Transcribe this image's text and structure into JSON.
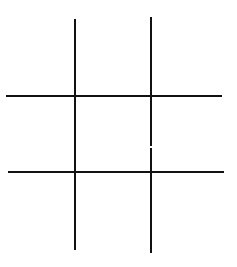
{
  "game": {
    "name": "tic-tac-toe",
    "colors": {
      "background": "#ffffff",
      "line": "#111111"
    },
    "line_width": 2,
    "grid_lines": {
      "vertical": [
        {
          "x1": 75,
          "y1": 19,
          "x2": 75,
          "y2": 250
        },
        {
          "x1": 151,
          "y1": 17,
          "x2": 151,
          "y2": 146
        },
        {
          "x1": 151,
          "y1": 148,
          "x2": 151,
          "y2": 253
        }
      ],
      "horizontal": [
        {
          "x1": 6,
          "y1": 96,
          "x2": 222,
          "y2": 96
        },
        {
          "x1": 8,
          "y1": 172,
          "x2": 224,
          "y2": 172
        }
      ]
    },
    "cells": [
      [
        "",
        "",
        ""
      ],
      [
        "",
        "",
        ""
      ],
      [
        "",
        "",
        ""
      ]
    ]
  }
}
